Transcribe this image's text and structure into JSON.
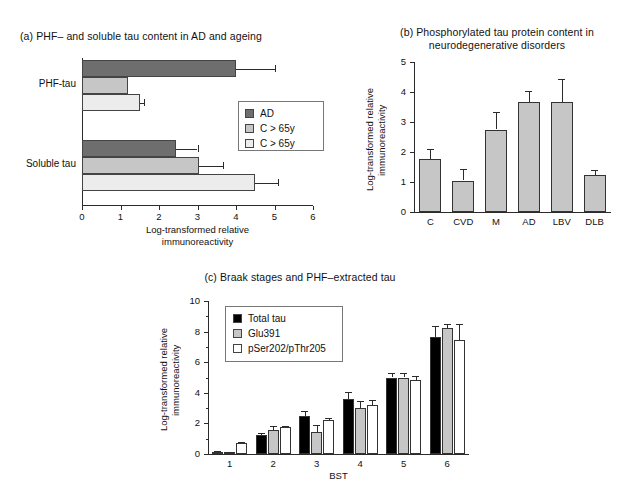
{
  "figure": {
    "panels": [
      "a",
      "b",
      "c"
    ]
  },
  "panel_a": {
    "title": "(a) PHF– and soluble tau content in AD and ageing",
    "legend": [
      {
        "label": "AD",
        "color": "#6e6e6e"
      },
      {
        "label": "C > 65y",
        "color": "#c6c6c6"
      },
      {
        "label": "C > 65y",
        "color": "#ececec"
      }
    ],
    "categories": [
      "PHF-tau",
      "Soluble tau"
    ],
    "xlabel": "Log-transformed relative immunoreactivity",
    "xticks": [
      "0",
      "1",
      "2",
      "3",
      "4",
      "5",
      "6"
    ]
  },
  "panel_b": {
    "title_line1": "(b) Phosphorylated tau protein content in",
    "title_line2": "neurodegenerative disorders",
    "ylabel": "Log-transformed relative immunoreactivity",
    "yticks": [
      "5",
      "4",
      "3",
      "2",
      "1",
      "0"
    ],
    "xticks": [
      "C",
      "CVD",
      "M",
      "AD",
      "LBV",
      "DLB"
    ]
  },
  "panel_c": {
    "title": "(c) Braak stages and PHF–extracted tau",
    "ylabel": "Log-transformed relative immunoreactivity",
    "xlabel": "BST",
    "yticks": [
      "10",
      "8",
      "6",
      "4",
      "2",
      "0"
    ],
    "xticks": [
      "1",
      "2",
      "3",
      "4",
      "5",
      "6"
    ],
    "legend": [
      {
        "label": "Total tau",
        "color": "#000000"
      },
      {
        "label": "Glu391",
        "color": "#c6c6c6"
      },
      {
        "label": "pSer202/pThr205",
        "color": "#ffffff"
      }
    ]
  },
  "chart_data": [
    {
      "panel": "a",
      "type": "bar",
      "orientation": "horizontal",
      "title": "(a) PHF– and soluble tau content in AD and ageing",
      "xlabel": "Log-transformed relative immunoreactivity",
      "ylabel": "",
      "xlim": [
        0,
        6
      ],
      "grid": false,
      "legend_position": "right",
      "categories": [
        "PHF-tau",
        "Soluble tau"
      ],
      "series": [
        {
          "name": "AD",
          "color": "#6e6e6e",
          "values": [
            4.0,
            2.45
          ],
          "errors": [
            1.0,
            0.55
          ]
        },
        {
          "name": "C > 65y",
          "color": "#c6c6c6",
          "values": [
            1.2,
            3.05
          ],
          "errors": [
            0.0,
            0.6
          ]
        },
        {
          "name": "C > 65y",
          "color": "#ececec",
          "values": [
            1.5,
            4.5
          ],
          "errors": [
            0.12,
            0.6
          ]
        }
      ]
    },
    {
      "panel": "b",
      "type": "bar",
      "orientation": "vertical",
      "title": "(b) Phosphorylated tau protein content in neurodegenerative disorders",
      "xlabel": "",
      "ylabel": "Log-transformed relative immunoreactivity",
      "ylim": [
        0,
        5
      ],
      "grid": false,
      "categories": [
        "C",
        "CVD",
        "M",
        "AD",
        "LBV",
        "DLB"
      ],
      "values": [
        1.78,
        1.05,
        2.75,
        3.68,
        3.68,
        1.22
      ],
      "errors": [
        0.32,
        0.37,
        0.58,
        0.35,
        0.75,
        0.18
      ],
      "bar_color": "#c6c6c6"
    },
    {
      "panel": "c",
      "type": "bar",
      "orientation": "vertical",
      "title": "(c) Braak stages and PHF–extracted tau",
      "xlabel": "BST",
      "ylabel": "Log-transformed relative immunoreactivity",
      "ylim": [
        0,
        10
      ],
      "grid": false,
      "legend_position": "top-left",
      "categories": [
        "1",
        "2",
        "3",
        "4",
        "5",
        "6"
      ],
      "series": [
        {
          "name": "Total tau",
          "color": "#000000",
          "values": [
            0.15,
            1.25,
            2.5,
            3.6,
            5.0,
            7.65
          ],
          "errors": [
            0.05,
            0.12,
            0.33,
            0.45,
            0.3,
            0.7
          ]
        },
        {
          "name": "Glu391",
          "color": "#c6c6c6",
          "values": [
            0.1,
            1.6,
            1.45,
            3.0,
            5.0,
            8.25
          ],
          "errors": [
            0.05,
            0.2,
            0.45,
            0.45,
            0.27,
            0.25
          ]
        },
        {
          "name": "pSer202/pThr205",
          "color": "#ffffff",
          "values": [
            0.7,
            1.75,
            2.2,
            3.2,
            4.85,
            7.45
          ],
          "errors": [
            0.07,
            0.08,
            0.13,
            0.35,
            0.25,
            1.05
          ]
        }
      ]
    }
  ]
}
